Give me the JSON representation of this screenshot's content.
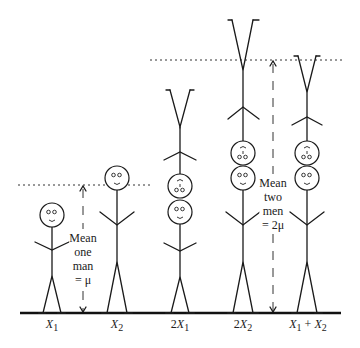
{
  "figures": [
    {
      "id": "x1",
      "label_html": "X<sub>1</sub>",
      "label": "X1"
    },
    {
      "id": "x2",
      "label": "X2"
    },
    {
      "id": "2x1",
      "label": "2X1"
    },
    {
      "id": "2x2",
      "label": "2X2"
    },
    {
      "id": "x1px2",
      "label": "X1 + X2"
    }
  ],
  "labels": {
    "x1": {
      "var": "X",
      "sub": "1",
      "prefix": ""
    },
    "x2": {
      "var": "X",
      "sub": "2",
      "prefix": ""
    },
    "two_x1": {
      "var": "X",
      "sub": "1",
      "prefix": "2"
    },
    "two_x2": {
      "var": "X",
      "sub": "2",
      "prefix": "2"
    },
    "sum": {
      "var1": "X",
      "sub1": "1",
      "op": " + ",
      "var2": "X",
      "sub2": "2"
    }
  },
  "annotations": {
    "one_man": {
      "lines": [
        "Mean",
        "one",
        "man",
        "= μ"
      ]
    },
    "two_men": {
      "lines": [
        "Mean",
        "two",
        "men",
        "= 2μ"
      ]
    }
  },
  "colors": {
    "ink": "#1a1a1a",
    "background": "#ffffff"
  }
}
